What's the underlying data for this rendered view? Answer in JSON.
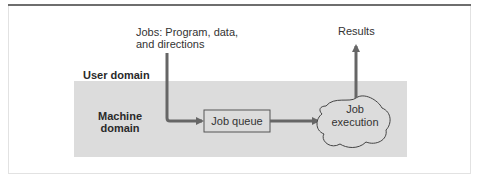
{
  "diagram": {
    "inputs_label": "Jobs: Program, data,",
    "inputs_label_line2": "and directions",
    "results_label": "Results",
    "user_domain_label": "User domain",
    "machine_domain_label_line1": "Machine",
    "machine_domain_label_line2": "domain",
    "job_queue_label": "Job queue",
    "job_execution_line1": "Job",
    "job_execution_line2": "execution",
    "colors": {
      "machine_domain_fill": "#dcdcdc",
      "arrow": "#666666",
      "box_stroke": "#555555"
    }
  }
}
